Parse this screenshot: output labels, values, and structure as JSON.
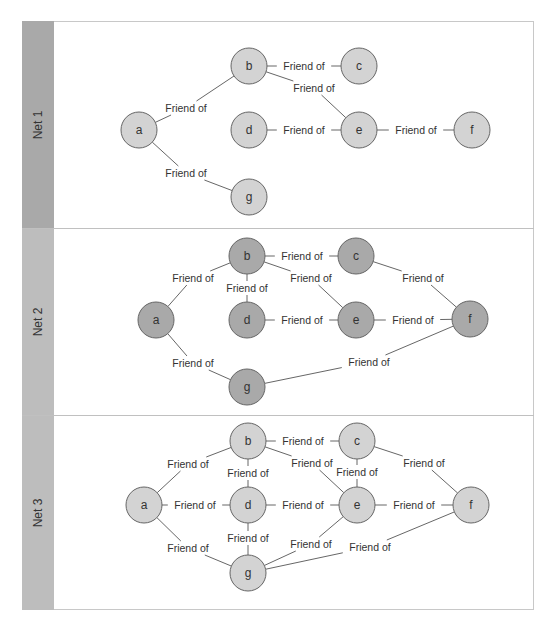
{
  "lanes": [
    {
      "label": "Net 1",
      "band_color": "#a9a9a9",
      "node_color": "#d3d3d3",
      "top": 21,
      "height": 207,
      "nodes": [
        {
          "id": "a",
          "x": 139,
          "y": 130
        },
        {
          "id": "b",
          "x": 249,
          "y": 66
        },
        {
          "id": "c",
          "x": 359,
          "y": 66
        },
        {
          "id": "d",
          "x": 249,
          "y": 130
        },
        {
          "id": "e",
          "x": 359,
          "y": 130
        },
        {
          "id": "f",
          "x": 472,
          "y": 130
        },
        {
          "id": "g",
          "x": 249,
          "y": 197
        }
      ],
      "edges": [
        {
          "from": "a",
          "to": "b",
          "label": "Friend of",
          "lx": 186,
          "ly": 108
        },
        {
          "from": "b",
          "to": "c",
          "label": "Friend of",
          "lx": 304,
          "ly": 66
        },
        {
          "from": "b",
          "to": "e",
          "label": "Friend of",
          "lx": 314,
          "ly": 88
        },
        {
          "from": "d",
          "to": "e",
          "label": "Friend of",
          "lx": 304,
          "ly": 130
        },
        {
          "from": "e",
          "to": "f",
          "label": "Friend of",
          "lx": 416,
          "ly": 130
        },
        {
          "from": "a",
          "to": "g",
          "label": "Friend of",
          "lx": 186,
          "ly": 173
        }
      ]
    },
    {
      "label": "Net 2",
      "band_color": "#bdbdbd",
      "node_color": "#a9a9a9",
      "top": 228,
      "height": 187,
      "nodes": [
        {
          "id": "a",
          "x": 156,
          "y": 320
        },
        {
          "id": "b",
          "x": 247,
          "y": 256
        },
        {
          "id": "c",
          "x": 356,
          "y": 256
        },
        {
          "id": "d",
          "x": 247,
          "y": 320
        },
        {
          "id": "e",
          "x": 356,
          "y": 320
        },
        {
          "id": "f",
          "x": 470,
          "y": 319
        },
        {
          "id": "g",
          "x": 247,
          "y": 387
        }
      ],
      "edges": [
        {
          "from": "a",
          "to": "b",
          "label": "Friend of",
          "lx": 193,
          "ly": 278
        },
        {
          "from": "b",
          "to": "c",
          "label": "Friend of",
          "lx": 302,
          "ly": 256
        },
        {
          "from": "b",
          "to": "d",
          "label": "Friend of",
          "lx": 247,
          "ly": 288
        },
        {
          "from": "b",
          "to": "e",
          "label": "Friend of",
          "lx": 311,
          "ly": 278
        },
        {
          "from": "c",
          "to": "f",
          "label": "Friend of",
          "lx": 423,
          "ly": 278
        },
        {
          "from": "d",
          "to": "e",
          "label": "Friend of",
          "lx": 302,
          "ly": 320
        },
        {
          "from": "e",
          "to": "f",
          "label": "Friend of",
          "lx": 413,
          "ly": 320
        },
        {
          "from": "a",
          "to": "g",
          "label": "Friend of",
          "lx": 193,
          "ly": 363
        },
        {
          "from": "g",
          "to": "f",
          "label": "Friend of",
          "lx": 369,
          "ly": 362
        }
      ]
    },
    {
      "label": "Net 3",
      "band_color": "#bdbdbd",
      "node_color": "#d3d3d3",
      "top": 415,
      "height": 195,
      "nodes": [
        {
          "id": "a",
          "x": 144,
          "y": 505
        },
        {
          "id": "b",
          "x": 248,
          "y": 441
        },
        {
          "id": "c",
          "x": 357,
          "y": 441
        },
        {
          "id": "d",
          "x": 248,
          "y": 505
        },
        {
          "id": "e",
          "x": 357,
          "y": 505
        },
        {
          "id": "f",
          "x": 471,
          "y": 505
        },
        {
          "id": "g",
          "x": 248,
          "y": 573
        }
      ],
      "edges": [
        {
          "from": "a",
          "to": "b",
          "label": "Friend of",
          "lx": 188,
          "ly": 464
        },
        {
          "from": "b",
          "to": "c",
          "label": "Friend of",
          "lx": 303,
          "ly": 441
        },
        {
          "from": "b",
          "to": "d",
          "label": "Friend of",
          "lx": 248,
          "ly": 473
        },
        {
          "from": "b",
          "to": "e",
          "label": "Friend of",
          "lx": 312,
          "ly": 463
        },
        {
          "from": "c",
          "to": "e",
          "label": "Friend of",
          "lx": 357,
          "ly": 472
        },
        {
          "from": "c",
          "to": "f",
          "label": "Friend of",
          "lx": 424,
          "ly": 463
        },
        {
          "from": "a",
          "to": "d",
          "label": "Friend of",
          "lx": 195,
          "ly": 505
        },
        {
          "from": "d",
          "to": "e",
          "label": "Friend of",
          "lx": 303,
          "ly": 505
        },
        {
          "from": "e",
          "to": "f",
          "label": "Friend of",
          "lx": 414,
          "ly": 505
        },
        {
          "from": "d",
          "to": "g",
          "label": "Friend of",
          "lx": 248,
          "ly": 538
        },
        {
          "from": "a",
          "to": "g",
          "label": "Friend of",
          "lx": 188,
          "ly": 548
        },
        {
          "from": "g",
          "to": "e",
          "label": "Friend of",
          "lx": 311,
          "ly": 544
        },
        {
          "from": "g",
          "to": "f",
          "label": "Friend of",
          "lx": 370,
          "ly": 547
        }
      ]
    }
  ],
  "style": {
    "edge_color": "#555555",
    "node_stroke": "#666666",
    "node_radius": 18,
    "label_color": "#333333",
    "frame_border": "#c8c8c8"
  }
}
